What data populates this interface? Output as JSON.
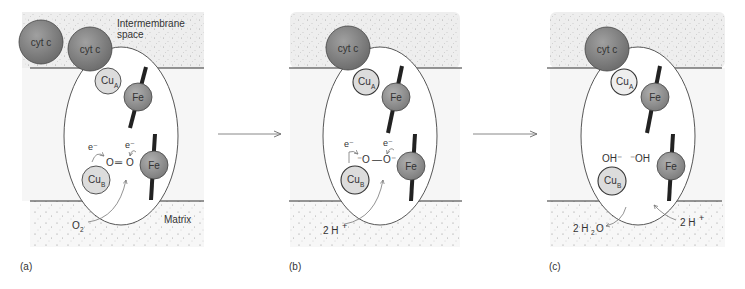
{
  "figure": {
    "colors": {
      "background": "#ffffff",
      "stipple_fill": "#eeeeee",
      "stipple_dot": "#9a9a9a",
      "membrane_fill": "#f6f6f6",
      "membrane_line": "#333333",
      "cyt_c_fill": "#7a7a7a",
      "fe_fill": "#8c8c8c",
      "cu_fill": "#dcdcdc",
      "heme_bar": "#222222",
      "arrow": "#888888",
      "text": "#333333"
    },
    "transition_arrows": [
      {
        "from": "a",
        "to": "b"
      },
      {
        "from": "b",
        "to": "c"
      }
    ],
    "panels": [
      {
        "id": "a",
        "caption": "(a)",
        "cyt_c": [
          "cyt c",
          "cyt c"
        ],
        "cu_a": {
          "base": "Cu",
          "sub": "A"
        },
        "cu_b": {
          "base": "Cu",
          "sub": "B"
        },
        "fe_top": "Fe",
        "fe_bottom": "Fe",
        "region_labels": {
          "top": [
            "Intermembrane",
            "space"
          ],
          "bottom": "Matrix"
        },
        "ligand": {
          "left": "O",
          "bond": "═",
          "right": "O"
        },
        "electrons": [
          "e⁻",
          "e⁻"
        ],
        "input": {
          "base": "O",
          "sub": "2"
        }
      },
      {
        "id": "b",
        "caption": "(b)",
        "cyt_c": [
          "cyt c"
        ],
        "cu_a": {
          "base": "Cu",
          "sub": "A"
        },
        "cu_b": {
          "base": "Cu",
          "sub": "B"
        },
        "fe_top": "Fe",
        "fe_bottom": "Fe",
        "ligand": {
          "left": "⁻O",
          "bond": "—",
          "right": "O⁻"
        },
        "electrons": [
          "e⁻",
          "e⁻"
        ],
        "input": {
          "text": "2 H",
          "sup": "+"
        }
      },
      {
        "id": "c",
        "caption": "(c)",
        "cyt_c": [
          "cyt c"
        ],
        "cu_a": {
          "base": "Cu",
          "sub": "A"
        },
        "cu_b": {
          "base": "Cu",
          "sub": "B"
        },
        "fe_top": "Fe",
        "fe_bottom": "Fe",
        "ligand": {
          "left": "OH⁻",
          "right": "⁻OH"
        },
        "output": {
          "pre": "2 H",
          "sub": "2",
          "post": "O"
        },
        "input": {
          "text": "2 H",
          "sup": "+"
        }
      }
    ]
  }
}
